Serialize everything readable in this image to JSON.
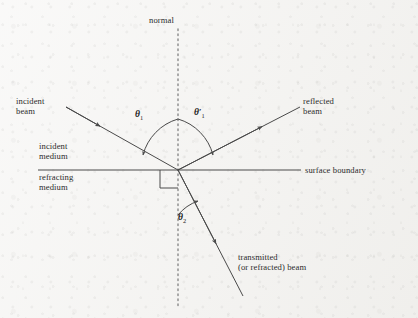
{
  "figure": {
    "kind": "optics-ray-diagram",
    "colors": {
      "background": "#f3f2f0",
      "ink": "#2b2b2b",
      "line": "#4a4a4a",
      "normal_dotted": "#8c8c8c"
    }
  },
  "labels": {
    "normal": "normal",
    "incident_beam_line1": "incident",
    "incident_beam_line2": "beam",
    "reflected_beam_line1": "reflected",
    "reflected_beam_line2": "beam",
    "incident_medium_line1": "incident",
    "incident_medium_line2": "medium",
    "refracting_medium_line1": "refracting",
    "refracting_medium_line2": "medium",
    "surface_boundary": "surface boundary",
    "transmitted_line1": "transmitted",
    "transmitted_line2": "(or refracted) beam"
  },
  "angles": {
    "theta1": "θ",
    "theta1_sub": "1",
    "theta1_prime": "θ",
    "theta1_prime_mark": "′",
    "theta1_prime_sub": "1",
    "theta2": "θ",
    "theta2_sub": "2"
  },
  "icons": {
    "incident_arrow": "arrow-head-icon",
    "reflected_arrow": "arrow-head-icon",
    "transmitted_arrow": "arrow-head-icon",
    "right_angle": "right-angle-marker-icon"
  }
}
